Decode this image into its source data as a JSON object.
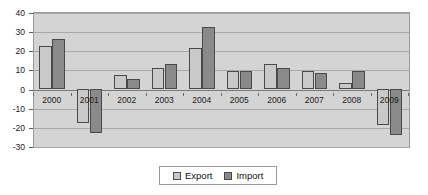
{
  "chart_data": {
    "type": "bar",
    "title": "",
    "subtitle": "",
    "xlabel": "",
    "ylabel": "",
    "categories": [
      "2000",
      "2001",
      "2002",
      "2003",
      "2004",
      "2005",
      "2006",
      "2007",
      "2008",
      "2009"
    ],
    "series": [
      {
        "name": "Export",
        "color": "#c9c9c9",
        "values": [
          22,
          -18,
          7,
          11,
          21,
          9,
          13,
          9,
          3,
          -19
        ]
      },
      {
        "name": "Import",
        "color": "#8a8a8a",
        "values": [
          26,
          -23,
          5,
          13,
          32,
          9,
          11,
          8,
          9,
          -24
        ]
      }
    ],
    "ylim": [
      -30,
      40
    ],
    "ytick_step": 10,
    "yticks": [
      40,
      30,
      20,
      10,
      0,
      -10,
      -20,
      -30
    ],
    "ytick_labels": [
      "40",
      "30",
      "20",
      "10",
      "0",
      "-10",
      "-20",
      "-30"
    ],
    "grid": true,
    "grid_axis": "y",
    "legend_position": "bottom-center",
    "plot_background": "#d4d4d4",
    "figure_background": "#ffffff",
    "annotations": []
  },
  "legend": {
    "items": [
      {
        "label": "Export",
        "swatch": "export-swatch-icon"
      },
      {
        "label": "Import",
        "swatch": "import-swatch-icon"
      }
    ]
  }
}
